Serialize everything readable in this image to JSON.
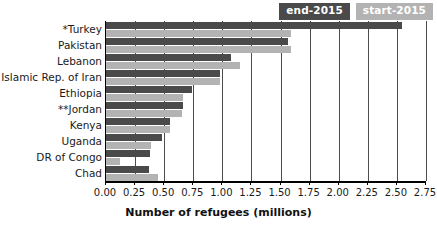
{
  "chart_data": {
    "type": "bar",
    "orientation": "horizontal",
    "title": "",
    "xlabel": "Number of refugees (millions)",
    "ylabel": "",
    "xlim": [
      0.0,
      2.75
    ],
    "xticks": [
      "0.00",
      "0.25",
      "0.50",
      "0.75",
      "1.00",
      "1.25",
      "1.50",
      "1.75",
      "2.00",
      "2.25",
      "2.50",
      "2.75"
    ],
    "xtick_values": [
      0.0,
      0.25,
      0.5,
      0.75,
      1.0,
      1.25,
      1.5,
      1.75,
      2.0,
      2.25,
      2.5,
      2.75
    ],
    "grid": true,
    "legend_position": "top-right",
    "categories": [
      "*Turkey",
      "Pakistan",
      "Lebanon",
      "Islamic Rep. of Iran",
      "Ethiopia",
      "**Jordan",
      "Kenya",
      "Uganda",
      "DR of Congo",
      "Chad"
    ],
    "series": [
      {
        "name": "end-2015",
        "color": "#4a4a4a",
        "values": [
          2.54,
          1.56,
          1.07,
          0.98,
          0.74,
          0.66,
          0.55,
          0.48,
          0.38,
          0.37
        ]
      },
      {
        "name": "start-2015",
        "color": "#b3b3b3",
        "values": [
          1.59,
          1.59,
          1.15,
          0.98,
          0.66,
          0.65,
          0.55,
          0.39,
          0.12,
          0.45
        ]
      }
    ]
  },
  "legend": {
    "items": [
      {
        "label": "end-2015",
        "color": "#4a4a4a"
      },
      {
        "label": "start-2015",
        "color": "#b3b3b3"
      }
    ]
  }
}
